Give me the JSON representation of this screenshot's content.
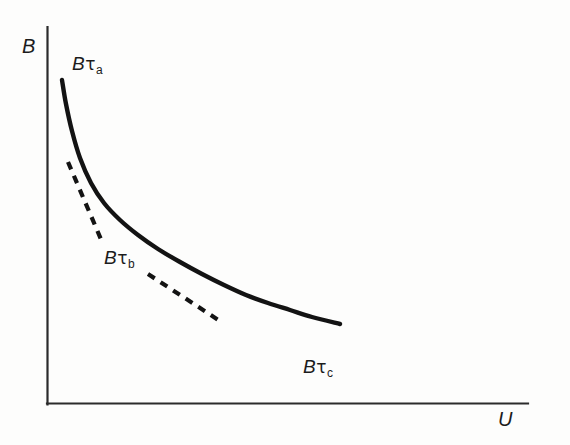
{
  "figure": {
    "background_color": "#fdfdfc",
    "ink_color": "#131313"
  },
  "axes": {
    "y_label": "B",
    "x_label": "U",
    "origin": [
      47,
      404
    ],
    "y_top": 27,
    "x_right": 528
  },
  "annotations": [
    {
      "id": "tau_a",
      "base": "B",
      "symbol": "τ",
      "subscript": "a"
    },
    {
      "id": "tau_b",
      "base": "B",
      "symbol": "τ",
      "subscript": "b"
    },
    {
      "id": "tau_c",
      "base": "B",
      "symbol": "τ",
      "subscript": "c"
    }
  ],
  "chart_data": {
    "type": "line",
    "title": "",
    "xlabel": "U",
    "ylabel": "B",
    "grid": false,
    "legend": "none",
    "axis_ticks": {
      "x": [],
      "y": []
    },
    "xlim": [
      47,
      528
    ],
    "ylim": [
      27,
      404
    ],
    "note": "Axes are unlabelled/unscaled schematic axes; coordinates are given in pixel space of the original figure (y increases downward).",
    "series": [
      {
        "name": "B curve (solid)",
        "style": "solid",
        "points": [
          [
            62,
            80
          ],
          [
            66,
            104
          ],
          [
            72,
            131
          ],
          [
            80,
            158
          ],
          [
            91,
            183
          ],
          [
            104,
            203
          ],
          [
            120,
            220
          ],
          [
            138,
            235
          ],
          [
            158,
            249
          ],
          [
            180,
            262
          ],
          [
            202,
            274
          ],
          [
            224,
            285
          ],
          [
            246,
            295
          ],
          [
            268,
            303
          ],
          [
            290,
            310
          ],
          [
            312,
            317
          ],
          [
            340,
            324
          ]
        ]
      },
      {
        "name": "tangent at tau_a/tau_b transition (dashed)",
        "style": "dashed",
        "points": [
          [
            68,
            162
          ],
          [
            103,
            244
          ]
        ]
      },
      {
        "name": "tangent at tau_b/tau_c transition (dashed)",
        "style": "dashed",
        "points": [
          [
            148,
            274
          ],
          [
            223,
            323
          ]
        ]
      }
    ],
    "label_positions": {
      "tau_a": [
        72,
        54
      ],
      "tau_b": [
        104,
        248
      ],
      "tau_c": [
        303,
        357
      ]
    }
  }
}
